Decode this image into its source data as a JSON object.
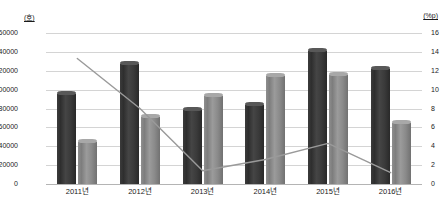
{
  "chart_data": {
    "type": "bar",
    "title": "",
    "subtitle": "",
    "xlabel": "",
    "ylabel": "",
    "y_unit_left": "(호)",
    "y_unit_right": "(%p)",
    "categories": [
      "2011년",
      "2012년",
      "2013년",
      "2014년",
      "2015년",
      "2016년"
    ],
    "ylim": [
      0,
      160000
    ],
    "ytick_step": 20000,
    "yticks_left": [
      "0",
      "20000",
      "40000",
      "60000",
      "80000",
      "100000",
      "120000",
      "140000",
      "160000"
    ],
    "ylim_right": [
      0,
      16
    ],
    "ytick_step_right": 2,
    "yticks_right": [
      "0",
      "2",
      "4",
      "6",
      "8",
      "10",
      "12",
      "14",
      "16"
    ],
    "grid": true,
    "legend": "none",
    "series": [
      {
        "name": "dark-bar-series",
        "kind": "bar",
        "axis": "left",
        "color": "#3a3a3a",
        "values": [
          99000,
          130000,
          82000,
          87000,
          144000,
          125000
        ]
      },
      {
        "name": "light-bar-series",
        "kind": "bar",
        "axis": "left",
        "color": "#8a8a8a",
        "values": [
          48000,
          74000,
          96000,
          118000,
          119000,
          68000
        ]
      },
      {
        "name": "line-series",
        "kind": "line",
        "axis": "right",
        "color": "#9a9a9a",
        "values": [
          13.3,
          8.0,
          1.4,
          2.6,
          4.3,
          1.2
        ]
      }
    ]
  },
  "axes": {
    "left_unit": "(호)",
    "right_unit": "(%p)"
  }
}
